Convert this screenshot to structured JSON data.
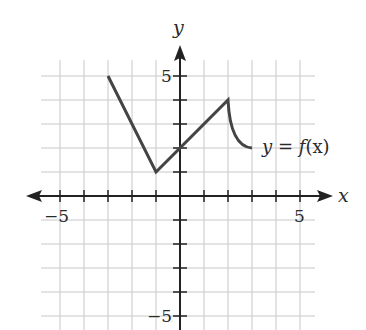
{
  "chart_data": {
    "type": "line",
    "title": "",
    "xlabel": "x",
    "ylabel": "y",
    "function_label": "y = f(x)",
    "xlim": [
      -5.8,
      5.6
    ],
    "ylim": [
      -5.6,
      5.7
    ],
    "grid": true,
    "x_tick_labels": [
      {
        "value": -5,
        "label": "−5"
      },
      {
        "value": 5,
        "label": "5"
      }
    ],
    "y_tick_labels": [
      {
        "value": 5,
        "label": "5"
      },
      {
        "value": -5,
        "label": "−5"
      }
    ],
    "series": [
      {
        "name": "f(x)",
        "segments": [
          {
            "kind": "linear",
            "points": [
              [
                -3,
                5
              ],
              [
                -1,
                1
              ]
            ]
          },
          {
            "kind": "linear",
            "points": [
              [
                -1,
                1
              ],
              [
                2,
                4
              ]
            ]
          },
          {
            "kind": "curve",
            "points": [
              [
                2,
                4
              ],
              [
                2.2,
                3.0
              ],
              [
                2.5,
                2.4
              ],
              [
                3,
                2
              ]
            ]
          }
        ]
      }
    ],
    "colors": {
      "curve": "#444444",
      "axis": "#222222",
      "grid": "#c8c8c8"
    }
  },
  "labels": {
    "x_axis": "x",
    "y_axis": "y",
    "x_neg5": "−5",
    "x_pos5": "5",
    "y_pos5": "5",
    "y_neg5": "−5",
    "func_y": "y",
    "func_eq": " = ",
    "func_f": "f",
    "func_x": "(x)"
  }
}
